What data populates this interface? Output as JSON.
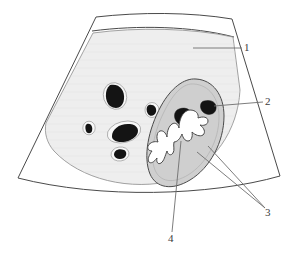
{
  "figure": {
    "kind": "line-art anatomical diagram",
    "background_color": "#ffffff",
    "line_color": "#4a4a4a"
  },
  "colors": {
    "sector_fill": "#ffffff",
    "parenchyma_fill": "#eeeeee",
    "organ_fill": "#cfcfcf",
    "vessel_fill": "#141414",
    "vessel_halo": "#f8f8f8",
    "lesion_fill": "#ffffff",
    "outline": "#4a4a4a",
    "leader_line": "#6e6e6e",
    "label_text": "#3b3b3b"
  },
  "regions": [
    {
      "id": "sector-field",
      "name": "ultrasound sector scan field",
      "fill": "#ffffff"
    },
    {
      "id": "near-field-band",
      "name": "near-field arc band",
      "fill": "#ffffff"
    },
    {
      "id": "parenchyma",
      "name": "homogeneous parenchyma",
      "fill": "#eeeeee"
    },
    {
      "id": "organ-oval",
      "name": "oval hypoechoic organ region",
      "fill": "#cfcfcf"
    },
    {
      "id": "stellate-lesion",
      "name": "irregular stellate anechoic area",
      "fill": "#ffffff"
    }
  ],
  "vessels": [
    {
      "id": "vessel-a",
      "cx": 115,
      "cy": 96,
      "rx": 8.5,
      "ry": 10.5,
      "rot": -18
    },
    {
      "id": "vessel-b",
      "cx": 152,
      "cy": 110,
      "rx": 4.5,
      "ry": 5.0,
      "rot": 0
    },
    {
      "id": "vessel-c",
      "cx": 89,
      "cy": 128,
      "rx": 3.6,
      "ry": 4.2,
      "rot": 0
    },
    {
      "id": "vessel-d",
      "cx": 124,
      "cy": 132,
      "rx": 14.0,
      "ry": 7.5,
      "rot": -14
    },
    {
      "id": "vessel-e",
      "cx": 120,
      "cy": 154,
      "rx": 6.5,
      "ry": 4.5,
      "rot": -8
    },
    {
      "id": "vessel-f",
      "cx": 185,
      "cy": 115,
      "rx": 7.5,
      "ry": 7.0,
      "rot": -10
    },
    {
      "id": "vessel-g",
      "cx": 209,
      "cy": 107,
      "rx": 7.0,
      "ry": 5.5,
      "rot": -18
    }
  ],
  "callouts": [
    {
      "number": "1",
      "name": "callout-1-scan-field",
      "text": "1",
      "label_x": 247,
      "label_y": 48,
      "leader": [
        [
          242,
          48
        ],
        [
          193,
          48
        ]
      ]
    },
    {
      "number": "2",
      "name": "callout-2-vessels",
      "text": "2",
      "label_x": 268,
      "label_y": 102,
      "leader": [
        [
          263,
          102
        ],
        [
          213,
          106
        ]
      ]
    },
    {
      "number": "3",
      "name": "callout-3-organ-oval",
      "text": "3",
      "label_x": 268,
      "label_y": 213,
      "leader": [
        [
          264,
          209
        ],
        [
          197,
          152
        ]
      ]
    },
    {
      "number": "4",
      "name": "callout-4-stellate-lesion",
      "text": "4",
      "label_x": 171,
      "label_y": 239,
      "leader": [
        [
          172,
          233
        ],
        [
          180,
          142
        ]
      ]
    }
  ]
}
